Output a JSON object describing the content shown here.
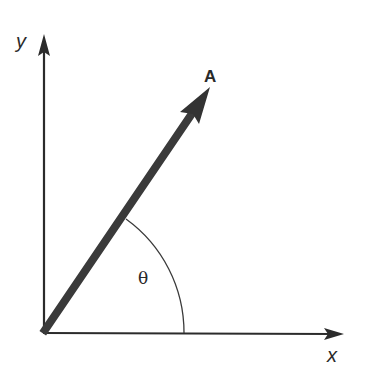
{
  "diagram": {
    "type": "vector-components-axes",
    "axes": {
      "x_label": "x",
      "y_label": "y"
    },
    "vector": {
      "label": "A",
      "origin": [
        44,
        331
      ],
      "tip": [
        210,
        88
      ]
    },
    "angle": {
      "label": "θ",
      "between": [
        "vector A",
        "x-axis"
      ]
    },
    "colors": {
      "axis": "#2b2b2b",
      "vector": "#3a3a3a",
      "background": "#ffffff"
    }
  }
}
